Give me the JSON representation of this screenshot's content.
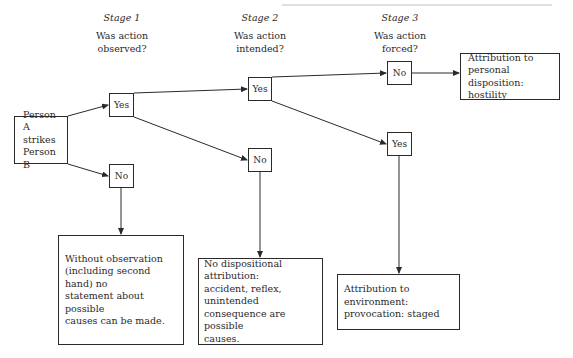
{
  "stages": [
    {
      "title": "Stage 1",
      "question_line1": "Was action",
      "question_line2": "observed?"
    },
    {
      "title": "Stage 2",
      "question_line1": "Was action",
      "question_line2": "intended?"
    },
    {
      "title": "Stage 3",
      "question_line1": "Was action",
      "question_line2": "forced?"
    }
  ],
  "start_node": {
    "line1": "Person A",
    "line2": "strikes",
    "line3": "Person B"
  },
  "decisions": {
    "stage1_yes": "Yes",
    "stage1_no": "No",
    "stage2_yes": "Yes",
    "stage2_no": "No",
    "stage3_no": "No",
    "stage3_yes": "Yes"
  },
  "outcomes": {
    "personal_disposition": {
      "line1": "Attribution to",
      "line2": "personal disposition:",
      "line3": "hostility"
    },
    "no_observation": {
      "line1": "Without observation",
      "line2": "(including second hand) no",
      "line3": "statement about possible",
      "line4": "causes can be made."
    },
    "no_dispositional": {
      "line1": "No dispositional attribution:",
      "line2": "accident, reflex, unintended",
      "line3": "consequence are possible",
      "line4": "causes."
    },
    "environment": {
      "line1": "Attribution to environment:",
      "line2": "provocation: staged"
    }
  },
  "colors": {
    "ink": "#2a2a2a",
    "background": "#ffffff"
  }
}
